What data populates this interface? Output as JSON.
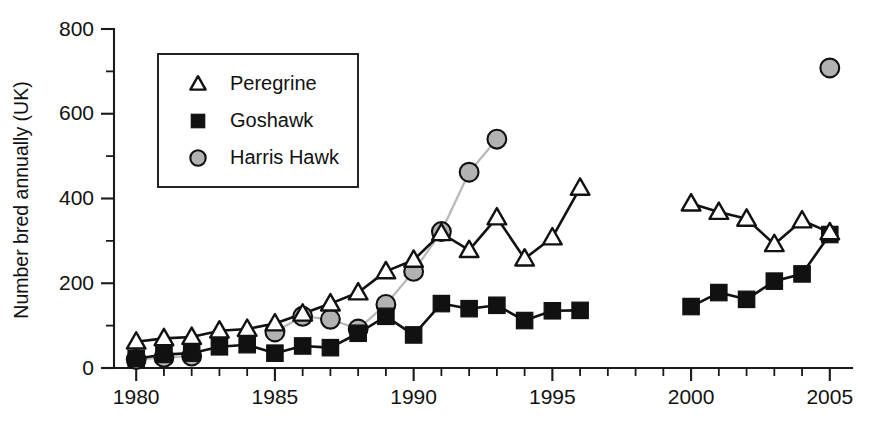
{
  "figure": {
    "background": "#ffffff",
    "ink_color": "#111111",
    "harris_fill": "#b2b2b2",
    "harris_line_color": "#b9b9b9"
  },
  "axes": {
    "y_title": "Number bred annually (UK)",
    "y_tick_labels": [
      "0",
      "200",
      "400",
      "600",
      "800"
    ],
    "y_tick_values": [
      0,
      200,
      400,
      600,
      800
    ],
    "y_minor_step": 100,
    "x_tick_labels": [
      "1980",
      "1985",
      "1990",
      "1995",
      "2000",
      "2005"
    ],
    "x_tick_values": [
      1980,
      1985,
      1990,
      1995,
      2000,
      2005
    ],
    "x_minor_step": 1
  },
  "legend": {
    "position": "upper-left-inside",
    "entries": [
      {
        "label": "Peregrine",
        "marker": "triangle-open",
        "marker_name": "triangle-open-marker"
      },
      {
        "label": "Goshawk",
        "marker": "square-filled",
        "marker_name": "square-filled-marker"
      },
      {
        "label": "Harris Hawk",
        "marker": "circle-gray",
        "marker_name": "circle-gray-marker"
      }
    ]
  },
  "chart_data": {
    "type": "line",
    "title": "",
    "subtitle": "",
    "xlabel": "",
    "ylabel": "Number bred annually (UK)",
    "xlim": [
      1979.2,
      2005.8
    ],
    "ylim": [
      0,
      800
    ],
    "grid": false,
    "legend_position": "upper left",
    "series": [
      {
        "name": "Peregrine",
        "marker": "triangle-open",
        "color": "#111111",
        "x": [
          1980,
          1981,
          1982,
          1983,
          1984,
          1985,
          1986,
          1987,
          1988,
          1989,
          1990,
          1991,
          1992,
          1993,
          1994,
          1995,
          1996,
          2000,
          2001,
          2002,
          2003,
          2004,
          2005
        ],
        "y": [
          62,
          70,
          73,
          88,
          92,
          105,
          128,
          152,
          178,
          228,
          255,
          318,
          278,
          355,
          258,
          308,
          425,
          388,
          368,
          352,
          292,
          348,
          320
        ]
      },
      {
        "name": "Goshawk",
        "marker": "square-filled",
        "color": "#111111",
        "x": [
          1980,
          1981,
          1982,
          1983,
          1984,
          1985,
          1986,
          1987,
          1988,
          1989,
          1990,
          1991,
          1992,
          1993,
          1994,
          1995,
          1996,
          2000,
          2001,
          2002,
          2003,
          2004,
          2005
        ],
        "y": [
          22,
          32,
          35,
          50,
          55,
          35,
          52,
          48,
          82,
          122,
          78,
          152,
          140,
          148,
          112,
          135,
          136,
          145,
          178,
          162,
          205,
          222,
          315
        ]
      },
      {
        "name": "Harris Hawk",
        "marker": "circle-gray",
        "color": "#b2b2b2",
        "x": [
          1980,
          1981,
          1982,
          1985,
          1986,
          1987,
          1988,
          1989,
          1990,
          1991,
          1992,
          1993,
          2005
        ],
        "y": [
          20,
          25,
          28,
          85,
          122,
          115,
          92,
          150,
          228,
          322,
          462,
          540,
          708
        ]
      }
    ],
    "notes": [
      "Peregrine and Goshawk series are broken between 1996 and 2000 (no data).",
      "Harris Hawk series has a single isolated point at 2005 with no connecting line."
    ]
  }
}
